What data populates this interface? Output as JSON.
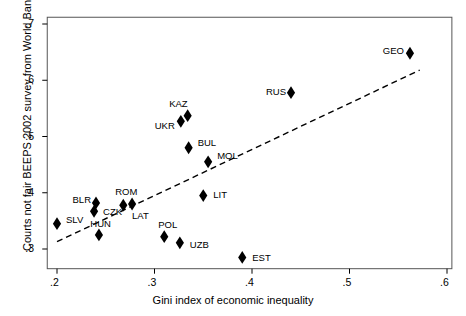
{
  "chart_data": {
    "type": "scatter",
    "title": "",
    "xlabel": "Gini index of economic inequality",
    "ylabel": "Courts not fair BEEPS 2002 survey from World Bank",
    "xlim": [
      0.19,
      0.605
    ],
    "ylim": [
      0.265,
      0.712
    ],
    "xticks": [
      ".2",
      ".3",
      ".4",
      ".5",
      ".6"
    ],
    "xtickvals": [
      0.2,
      0.3,
      0.4,
      0.5,
      0.6
    ],
    "yticks": [
      ".3",
      ".4",
      ".5",
      ".6",
      ".7"
    ],
    "ytickvals": [
      0.3,
      0.4,
      0.5,
      0.6,
      0.7
    ],
    "grid": false,
    "legend": "none",
    "marker": "filled-diamond",
    "marker_color": "#000000",
    "points": [
      {
        "label": "SLV",
        "x": 0.2,
        "y": 0.345,
        "lx": 9,
        "ly": -4
      },
      {
        "label": "BLR",
        "x": 0.24,
        "y": 0.382,
        "lx": -21,
        "ly": -3
      },
      {
        "label": "CZK",
        "x": 0.238,
        "y": 0.367,
        "lx": 9,
        "ly": 1
      },
      {
        "label": "HUN",
        "x": 0.243,
        "y": 0.325,
        "lx": -4,
        "ly": -11
      },
      {
        "label": "ROM",
        "x": 0.268,
        "y": 0.378,
        "lx": -2,
        "ly": -13
      },
      {
        "label": "LAT",
        "x": 0.277,
        "y": 0.38,
        "lx": 0,
        "ly": 12
      },
      {
        "label": "UKR",
        "x": 0.327,
        "y": 0.527,
        "lx": -22,
        "ly": 5
      },
      {
        "label": "KAZ",
        "x": 0.334,
        "y": 0.537,
        "lx": -16,
        "ly": -12
      },
      {
        "label": "BUL",
        "x": 0.335,
        "y": 0.48,
        "lx": 9,
        "ly": -5
      },
      {
        "label": "MOL",
        "x": 0.355,
        "y": 0.455,
        "lx": 9,
        "ly": -6
      },
      {
        "label": "POL",
        "x": 0.31,
        "y": 0.322,
        "lx": -3,
        "ly": -12
      },
      {
        "label": "UZB",
        "x": 0.326,
        "y": 0.311,
        "lx": 10,
        "ly": 2
      },
      {
        "label": "LIT",
        "x": 0.35,
        "y": 0.395,
        "lx": 10,
        "ly": -1
      },
      {
        "label": "EST",
        "x": 0.39,
        "y": 0.285,
        "lx": 10,
        "ly": 1
      },
      {
        "label": "RUS",
        "x": 0.44,
        "y": 0.578,
        "lx": -21,
        "ly": -1
      },
      {
        "label": "GEO",
        "x": 0.562,
        "y": 0.648,
        "lx": -22,
        "ly": -2
      }
    ],
    "trendline": {
      "style": "dashed",
      "color": "#000000",
      "x0": 0.2,
      "y0": 0.313,
      "x1": 0.572,
      "y1": 0.618
    }
  }
}
